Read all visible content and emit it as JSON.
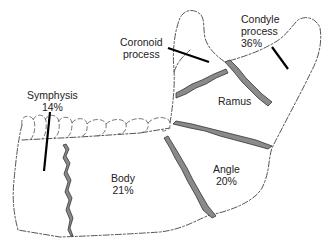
{
  "diagram": {
    "regions": [
      {
        "id": "coronoid",
        "name": "Coronoid",
        "name2": "process",
        "percent": ""
      },
      {
        "id": "condyle",
        "name": "Condyle",
        "name2": "process",
        "percent": "36%"
      },
      {
        "id": "ramus",
        "name": "Ramus",
        "percent": ""
      },
      {
        "id": "symphysis",
        "name": "Symphysis",
        "percent": "14%"
      },
      {
        "id": "body",
        "name": "Body",
        "percent": "21%"
      },
      {
        "id": "angle",
        "name": "Angle",
        "percent": "20%"
      }
    ],
    "colors": {
      "outline": "#555555",
      "fracture_fill": "#8a8a8a",
      "pointer": "#000000",
      "text": "#222222"
    }
  }
}
